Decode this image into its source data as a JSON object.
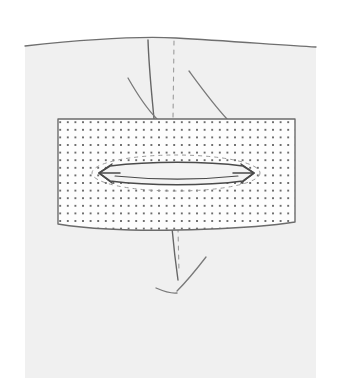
{
  "figure": {
    "domain_note": "Line-drawing medical illustration, no interface chrome",
    "canvas": {
      "width": 337,
      "height": 378
    },
    "colors": {
      "page_background": "#ffffff",
      "tissue_fill": "#f0f0f0",
      "tissue_edge": "#8d8d8d",
      "contour_line": "#6f6f6f",
      "mesh_fill": "#fdfdfd",
      "mesh_border": "#6b6b6b",
      "mesh_dot": "#3c3c3c",
      "defect_outline": "#4a4a4a",
      "defect_fill": "#f3f3f3",
      "dashed_guide": "#9b9b9b",
      "incision_line": "#666666",
      "retractor_line": "#7a7a7a"
    }
  },
  "regions": {
    "tissue": {
      "name": "abdominal-wall-tissue",
      "left": 25,
      "right": 316,
      "top_contour_y": 40,
      "bottom": 378,
      "path": "M25,46 C80,40 140,36 176,38 C230,41 280,45 316,47 L316,378 L25,378 Z"
    },
    "tissue_contour": {
      "name": "skin-surface-contour",
      "path": "M25,46 C80,40 140,36 176,38 C230,41 280,45 316,47",
      "stroke_width": 1.3
    }
  },
  "mesh": {
    "name": "prosthetic-mesh-patch",
    "x": 58,
    "y": 119,
    "width": 237,
    "height": 108,
    "outline_path": "M58,119 L295,119 L295,222 C250,229 160,232 108,229 C88,228 70,226 58,224 Z",
    "border_width": 1.4,
    "dot_grid": {
      "spacing_x": 7.6,
      "spacing_y": 7.6,
      "dot_radius": 0.95,
      "origin_x": 64,
      "origin_y": 126,
      "columns": 31,
      "rows": 14
    }
  },
  "defect": {
    "name": "hernia-defect-slit",
    "center_x": 176,
    "center_y": 173,
    "half_length": 77,
    "half_height": 7,
    "tip_spread": 9,
    "lens_path": "M99,173 L110,166 C150,161 205,161 243,166 L254,173 L243,181 C205,186 150,186 110,181 Z",
    "tip_left_path": "M99,173 L112,164 M99,173 L112,183 M99,173 L120,173",
    "tip_right_path": "M254,173 L241,164 M254,173 L241,183 M254,173 L233,173",
    "inner_highlight_path": "M115,176 C155,180 200,180 238,176"
  },
  "guides": {
    "dashed_ellipse": {
      "name": "defect-margin-dashed-ellipse",
      "cx": 176,
      "cy": 173,
      "rx": 84,
      "ry": 18,
      "dash": "4 4",
      "stroke_width": 1.0
    },
    "midline_dashed_upper": {
      "name": "midline-dashed-guide-upper",
      "path": "M174,41 L173,119",
      "dash": "4 5",
      "stroke_width": 1.1
    },
    "midline_dashed_lower": {
      "name": "midline-dashed-guide-lower",
      "path": "M178,228 L179,272",
      "dash": "4 5",
      "stroke_width": 1.1
    }
  },
  "incisions": {
    "upper_vertical": {
      "name": "upper-incision-line",
      "path": "M148,40 C149,70 152,96 154,119",
      "stroke_width": 1.4
    },
    "lower_vertical": {
      "name": "lower-incision-line",
      "path": "M172,228 C174,250 176,266 178,280",
      "stroke_width": 1.4
    }
  },
  "retractors": {
    "upper_left": {
      "name": "retractor-flap-upper-left",
      "path": "M128,78 C136,92 146,108 157,119",
      "stroke_width": 1.3
    },
    "upper_right": {
      "name": "retractor-flap-upper-right",
      "path": "M189,71 C200,86 213,104 227,119",
      "stroke_width": 1.3
    },
    "lower_right": {
      "name": "retractor-flap-lower-right",
      "path": "M206,257 C196,270 186,282 177,291",
      "stroke_width": 1.3
    },
    "lower_left": {
      "name": "retractor-flap-lower-left",
      "path": "M156,288 C163,291 170,294 177,293",
      "stroke_width": 1.3
    }
  }
}
